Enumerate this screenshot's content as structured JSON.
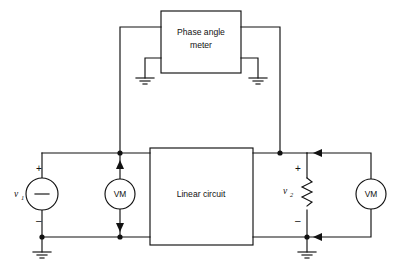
{
  "figure": {
    "type": "electrical-schematic",
    "stroke_color": "#111111",
    "background_color": "#ffffff"
  },
  "blocks": {
    "phase_meter": {
      "label_line1": "Phase angle",
      "label_line2": "meter",
      "x": 161,
      "y": 11,
      "w": 80,
      "h": 62
    },
    "linear_circuit": {
      "label": "Linear circuit",
      "x": 150,
      "y": 148,
      "w": 103,
      "h": 97
    }
  },
  "meters": [
    {
      "name": "voltmeter-left",
      "label": "VM",
      "cx": 120,
      "cy": 194,
      "r": 15
    },
    {
      "name": "voltmeter-right",
      "label": "VM",
      "cx": 371,
      "cy": 194,
      "r": 15
    }
  ],
  "source": {
    "name": "source-v1",
    "label": "v",
    "subscript": "1",
    "inner_symbol": "–",
    "plus": "+",
    "minus": "–",
    "cx": 42,
    "cy": 194,
    "r": 16
  },
  "load": {
    "name": "resistor-v2",
    "label": "v",
    "subscript": "2",
    "plus": "+",
    "minus": "–",
    "x": 307,
    "y_top": 178,
    "y_bottom": 210
  },
  "grounds": [
    {
      "name": "ground-phase-meter-left",
      "x": 145,
      "y": 78
    },
    {
      "name": "ground-phase-meter-right",
      "x": 258,
      "y": 78
    },
    {
      "name": "ground-source-v1",
      "x": 42,
      "y": 252
    },
    {
      "name": "ground-load-v2",
      "x": 307,
      "y": 252
    }
  ],
  "junctions": [
    {
      "name": "node-top-left-probe",
      "x": 120,
      "y": 153
    },
    {
      "name": "node-bottom-left-probe",
      "x": 120,
      "y": 237
    },
    {
      "name": "node-source-bottom",
      "x": 42,
      "y": 237
    },
    {
      "name": "node-top-right-probe",
      "x": 280,
      "y": 153
    },
    {
      "name": "node-load-bottom",
      "x": 307,
      "y": 237
    }
  ],
  "arrows": [
    {
      "name": "arrow-left-vm-top",
      "direction": "up"
    },
    {
      "name": "arrow-left-vm-bottom",
      "direction": "down"
    },
    {
      "name": "arrow-right-vm-top",
      "direction": "left"
    },
    {
      "name": "arrow-right-vm-bottom",
      "direction": "left"
    }
  ]
}
